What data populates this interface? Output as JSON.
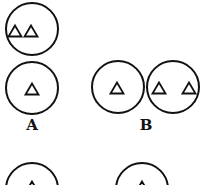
{
  "figure": {
    "stroke_color": "#111111",
    "background": "#ffffff",
    "circles": [
      {
        "id": "top-circle",
        "cx": 32,
        "cy": 29,
        "r": 26,
        "triangles": [
          {
            "x": 15,
            "y": 31
          },
          {
            "x": 31,
            "y": 31
          }
        ]
      },
      {
        "id": "circle-a",
        "cx": 32,
        "cy": 88,
        "r": 26,
        "triangles": [
          {
            "x": 32,
            "y": 89
          }
        ]
      },
      {
        "id": "circle-b1",
        "cx": 118,
        "cy": 87,
        "r": 26,
        "triangles": [
          {
            "x": 117,
            "y": 88
          }
        ]
      },
      {
        "id": "circle-b2",
        "cx": 173,
        "cy": 87,
        "r": 26,
        "triangles": [
          {
            "x": 159,
            "y": 88
          },
          {
            "x": 189,
            "y": 88
          }
        ]
      },
      {
        "id": "circle-c-partial",
        "cx": 32,
        "cy": 189,
        "r": 26,
        "triangles": [
          {
            "x": 32,
            "y": 187
          }
        ]
      },
      {
        "id": "circle-d-partial",
        "cx": 142,
        "cy": 189,
        "r": 26,
        "triangles": [
          {
            "x": 142,
            "y": 187
          }
        ]
      }
    ],
    "labels": {
      "a": "A",
      "b": "B"
    }
  }
}
